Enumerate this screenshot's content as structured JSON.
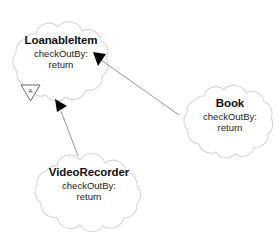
{
  "diagram": {
    "type": "uml-class-diagram",
    "background_color": "#ffffff",
    "cloud_stroke_color": "#d8d8d8",
    "cloud_fill_color": "#ffffff",
    "edge_color": "#8a8a8a",
    "arrowhead_color": "#000000",
    "text_color": "#1a1a1a",
    "nodes": [
      {
        "id": "loanableitem",
        "title": "LoanableItem",
        "attributes": [
          "checkOutBy:",
          "return"
        ],
        "abstract": true,
        "abstract_marker_label": "A"
      },
      {
        "id": "book",
        "title": "Book",
        "attributes": [
          "checkOutBy:",
          "return"
        ],
        "abstract": false
      },
      {
        "id": "videorecorder",
        "title": "VideoRecorder",
        "attributes": [
          "checkOutBy:",
          "return"
        ],
        "abstract": false
      }
    ],
    "edges": [
      {
        "id": "book-to-loanableitem",
        "from": "book",
        "to": "loanableitem",
        "arrowhead": "solid-triangle"
      },
      {
        "id": "videorecorder-to-loanableitem",
        "from": "videorecorder",
        "to": "loanableitem",
        "arrowhead": "solid-triangle"
      }
    ]
  }
}
